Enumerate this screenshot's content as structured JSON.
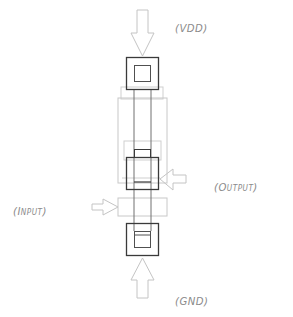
{
  "diagram": {
    "type": "cmos-inverter-layout",
    "labels": {
      "vdd": "(VDD)",
      "output": "(OUTPUT)",
      "input": "(INPUT)",
      "gnd": "(GND)"
    },
    "label_parts": {
      "vdd": [
        "(VDD)"
      ],
      "output": [
        "(O",
        "UTPUT",
        ")"
      ],
      "input": [
        "(I",
        "NPUT",
        ")"
      ],
      "gnd": [
        "(GND)"
      ]
    },
    "colors": {
      "dark_line": "#3a3a3a",
      "mid_line": "#707070",
      "light_line": "#c8c8c8",
      "arrow_line": "#c4c4c4",
      "label_text": "#8a8a8a",
      "background": "#ffffff"
    }
  }
}
